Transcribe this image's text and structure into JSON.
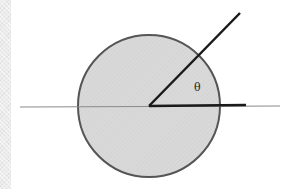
{
  "diagram": {
    "type": "geometry",
    "angle_label": "θ",
    "colors": {
      "circle_fill": "#d9d9d9",
      "circle_stroke": "#555555",
      "axis_line": "#8a8a8a",
      "ray": "#1a1a1a",
      "left_strip": "#ececec"
    },
    "circle": {
      "cx": 149,
      "cy": 106,
      "r": 71
    },
    "axis": {
      "x1": 20,
      "y1": 107,
      "x2": 280,
      "y2": 106
    },
    "ray_horizontal": {
      "x1": 149,
      "y1": 106,
      "x2": 246,
      "y2": 105
    },
    "ray_angled": {
      "x1": 149,
      "y1": 106,
      "x2": 240,
      "y2": 13
    },
    "label_position": {
      "x": 198,
      "y": 90
    }
  }
}
